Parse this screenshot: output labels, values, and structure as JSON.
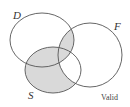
{
  "diagram": {
    "type": "venn",
    "sets": [
      {
        "name": "D",
        "label": "D"
      },
      {
        "name": "F",
        "label": "F"
      },
      {
        "name": "S",
        "label": "S"
      }
    ],
    "shaded_regions": [
      "D∩F only",
      "D∩S only",
      "S only",
      "D∩S∩F"
    ],
    "unshaded_regions": [
      "D only",
      "F only",
      "S∩F only"
    ],
    "caption": "Valid",
    "colors": {
      "shade": "#d9d9d9",
      "stroke": "#555555",
      "background": "#ffffff"
    }
  }
}
